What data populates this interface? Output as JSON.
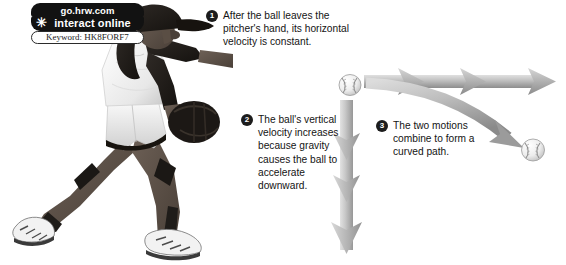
{
  "figure": {
    "background_color": "#ffffff",
    "width": 566,
    "height": 265
  },
  "logo": {
    "site": "go.hrw.com",
    "action": "interact online",
    "keyword_label": "Keyword: HK8FORF7",
    "star_glyph": "✳",
    "pill_color": "#121212",
    "pill_text_color": "#ffffff"
  },
  "subject": {
    "name": "softball-pitcher",
    "description": "Female softball pitcher in lunging follow-through, dark cap and ponytail, white sleeveless jersey with dark sleeves, white shorts, knee pads, sneakers, dark glove on left hand"
  },
  "callouts": [
    {
      "number": "1",
      "text": "After the ball leaves the pitcher's hand, its horizontal velocity is constant."
    },
    {
      "number": "2",
      "text": "The ball's vertical velocity increases because gravity causes the ball to accelerate downward."
    },
    {
      "number": "3",
      "text": "The two motions combine to form a curved path."
    }
  ],
  "vectors": {
    "horizontal_arrow": {
      "label": "horizontal-velocity-arrow",
      "chevron_count": 3,
      "direction": "right",
      "color_light": "#d2d2d2",
      "color_dark": "#8f8f8f"
    },
    "vertical_arrow": {
      "label": "vertical-velocity-arrow",
      "chevron_count": 3,
      "direction": "down",
      "color_light": "#d8d8d8",
      "color_dark": "#9a9a9a"
    },
    "curved_arrow": {
      "label": "curved-path-arrow",
      "direction": "down-right",
      "color_light": "#cfcfcf",
      "color_dark": "#8a8a8a"
    }
  },
  "balls": [
    {
      "label": "softball-start",
      "position": "upper-left"
    },
    {
      "label": "softball-end",
      "position": "lower-right"
    }
  ]
}
